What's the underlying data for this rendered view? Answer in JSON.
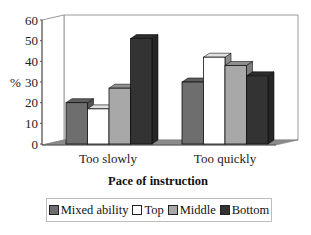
{
  "chart_data": {
    "type": "bar",
    "style": "3d-clustered-column",
    "title": "",
    "xlabel": "Pace of instruction",
    "ylabel": "%",
    "ylim": [
      0,
      60
    ],
    "yticks": [
      0,
      10,
      20,
      30,
      40,
      50,
      60
    ],
    "categories": [
      "Too slowly",
      "Too quickly"
    ],
    "series": [
      {
        "name": "Mixed ability",
        "color": "#6e6e6e",
        "values": [
          20,
          30
        ]
      },
      {
        "name": "Top",
        "color": "#ffffff",
        "values": [
          17,
          42
        ]
      },
      {
        "name": "Middle",
        "color": "#a8a8a8",
        "values": [
          27,
          38
        ]
      },
      {
        "name": "Bottom",
        "color": "#333333",
        "values": [
          51,
          33
        ]
      }
    ],
    "grid": false,
    "legend_position": "bottom"
  },
  "axis": {
    "ylabel": "%",
    "xlabel": "Pace of instruction"
  },
  "legend": {
    "items": [
      {
        "label": "Mixed ability",
        "color": "#6e6e6e"
      },
      {
        "label": "Top",
        "color": "#ffffff"
      },
      {
        "label": "Middle",
        "color": "#a8a8a8"
      },
      {
        "label": "Bottom",
        "color": "#333333"
      }
    ]
  }
}
